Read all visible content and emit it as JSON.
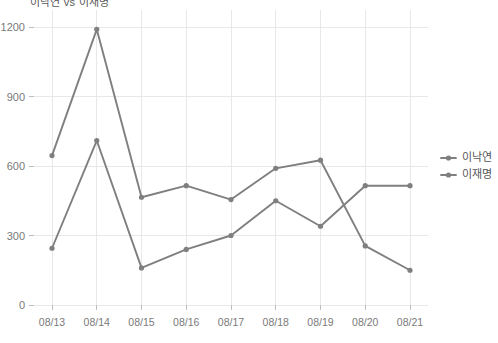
{
  "chart_data": {
    "type": "line",
    "title": "이낙연 vs 이재명",
    "xlabel": "",
    "ylabel": "",
    "categories": [
      "08/13",
      "08/14",
      "08/15",
      "08/16",
      "08/17",
      "08/18",
      "08/19",
      "08/20",
      "08/21"
    ],
    "series": [
      {
        "name": "이낙연",
        "color": "#7f7f7f",
        "values": [
          645,
          1190,
          465,
          515,
          455,
          590,
          625,
          255,
          150
        ]
      },
      {
        "name": "이재명",
        "color": "#7f7f7f",
        "values": [
          245,
          710,
          160,
          240,
          300,
          450,
          340,
          515,
          515
        ]
      }
    ],
    "ylim": [
      0,
      1250
    ],
    "yticks": [
      0,
      300,
      600,
      900,
      1200
    ],
    "ytick_labels": [
      "0",
      "300",
      "600",
      "900",
      "1200"
    ],
    "grid": true,
    "legend_position": "right"
  },
  "legend": {
    "entries": [
      {
        "label": "이낙연"
      },
      {
        "label": "이재명"
      }
    ]
  },
  "colors": {
    "series_gray": "#7f7f7f",
    "grid": "#e8e8e8",
    "tick_text": "#7a7a7a",
    "legend_text": "#555555",
    "background": "#ffffff"
  }
}
